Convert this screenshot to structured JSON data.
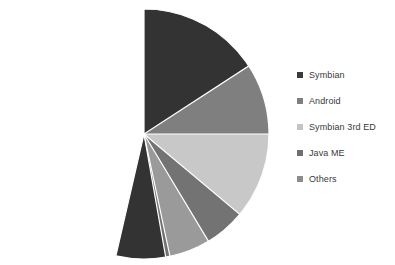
{
  "chart_data": {
    "type": "pie",
    "title": "",
    "xlabel": "",
    "ylabel": "",
    "legend_position": "right",
    "grid": false,
    "start_angle_deg": 90,
    "direction": "clockwise",
    "categories": [
      "Symbian",
      "Android",
      "Symbian 3rd ED",
      "Java ME",
      "Others"
    ],
    "values": [
      53.6,
      16.1,
      13.9,
      11.1,
      5.3
    ],
    "units": "percent",
    "colors": [
      "#333333",
      "#7f7f7f",
      "#c8c8c8",
      "#737373",
      "#9a9a9a"
    ],
    "slices": [
      {
        "label": "Symbian",
        "value": 53.6,
        "color": "#333333",
        "start_deg": 90,
        "sweep_deg": 193.0
      },
      {
        "label": "Android",
        "value": 16.1,
        "color": "#7f7f7f",
        "start_deg": 33.0,
        "sweep_deg": 58.0
      },
      {
        "label": "Symbian 3rd ED",
        "value": 13.9,
        "color": "#c8c8c8",
        "start_deg": 360.0,
        "sweep_deg": 50.0
      },
      {
        "label": "Java ME",
        "value": 11.1,
        "color": "#737373",
        "start_deg": 320.0,
        "sweep_deg": 40.0
      },
      {
        "label": "Others",
        "value": 5.3,
        "color": "#9a9a9a",
        "start_deg": 301.0,
        "sweep_deg": 19.0
      }
    ]
  },
  "legend": {
    "items": [
      {
        "label": "Symbian",
        "swatch": "#3b3b3b"
      },
      {
        "label": "Android",
        "swatch": "#7f7f7f"
      },
      {
        "label": "Symbian 3rd ED",
        "swatch": "#c4c4c4"
      },
      {
        "label": "Java ME",
        "swatch": "#6f6f6f"
      },
      {
        "label": "Others",
        "swatch": "#8c8c8c"
      }
    ]
  }
}
